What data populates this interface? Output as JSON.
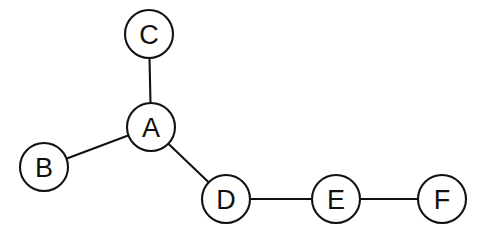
{
  "diagram": {
    "background_color": "#ffffff",
    "stroke_color": "#111111",
    "node_fill_color": "#ffffff",
    "node_radius": 24,
    "edge_width": 2.1,
    "width": 479,
    "height": 240
  },
  "chart_data": {
    "type": "diagram",
    "graph_type": "undirected",
    "nodes": [
      {
        "id": "C",
        "label": "C",
        "x": 149,
        "y": 34
      },
      {
        "id": "A",
        "label": "A",
        "x": 151,
        "y": 127
      },
      {
        "id": "B",
        "label": "B",
        "x": 44,
        "y": 167
      },
      {
        "id": "D",
        "label": "D",
        "x": 226,
        "y": 199
      },
      {
        "id": "E",
        "label": "E",
        "x": 336,
        "y": 199
      },
      {
        "id": "F",
        "label": "F",
        "x": 442,
        "y": 199
      }
    ],
    "edges": [
      {
        "source": "C",
        "target": "A"
      },
      {
        "source": "B",
        "target": "A"
      },
      {
        "source": "A",
        "target": "D"
      },
      {
        "source": "D",
        "target": "E"
      },
      {
        "source": "E",
        "target": "F"
      }
    ],
    "node_degrees": {
      "A": 3,
      "B": 1,
      "C": 1,
      "D": 2,
      "E": 2,
      "F": 1
    },
    "edge_count": 5,
    "node_count": 6
  }
}
